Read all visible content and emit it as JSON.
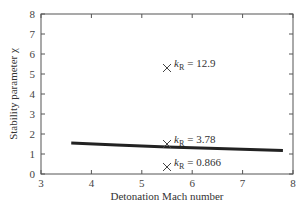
{
  "chart_data": {
    "type": "line",
    "title": "",
    "xlabel": "Detonation Mach number",
    "ylabel": "Stability parameter χ",
    "xlim": [
      3,
      8
    ],
    "ylim": [
      0,
      8
    ],
    "xticks": [
      "3",
      "4",
      "5",
      "6",
      "7",
      "8"
    ],
    "yticks": [
      "0",
      "1",
      "2",
      "3",
      "4",
      "5",
      "6",
      "7",
      "8"
    ],
    "grid": false,
    "series": [
      {
        "name": "curve",
        "style": "line",
        "x": [
          3.6,
          4.5,
          5.5,
          6.5,
          7.8
        ],
        "y": [
          1.55,
          1.45,
          1.35,
          1.27,
          1.18
        ]
      },
      {
        "name": "points",
        "style": "scatter-x",
        "x": [
          5.5,
          5.5,
          5.5
        ],
        "y": [
          5.3,
          1.5,
          0.35
        ],
        "labels": [
          "kR = 12.9",
          "kR = 3.78",
          "kR = 0.866"
        ]
      }
    ]
  },
  "axes": {
    "xlabel": "Detonation Mach number",
    "ylabel": "Stability parameter χ"
  },
  "annotations": [
    {
      "k": "k",
      "sub": "R",
      "value": "= 12.9"
    },
    {
      "k": "k",
      "sub": "R",
      "value": "= 3.78"
    },
    {
      "k": "k",
      "sub": "R",
      "value": "= 0.866"
    }
  ]
}
